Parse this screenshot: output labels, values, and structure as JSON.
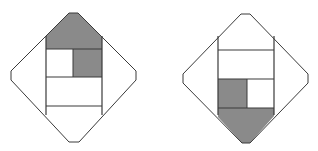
{
  "figure": {
    "width": 318,
    "height": 151,
    "background": "#ffffff",
    "stroke_color": "#3a3a3a",
    "shade_color": "#8a8a8a"
  },
  "diagrams": [
    {
      "id": "left",
      "outline": "69,13 78,13 136,71 136,80 79,142 69,142 11,80 11,71",
      "inner_rect": {
        "x1": 46,
        "x2": 102,
        "y_top": 36,
        "y_bottom": 115
      },
      "row_lines": [
        49,
        77,
        106
      ],
      "shaded_regions": [
        {
          "name": "top-pentagon",
          "points": "69,13 78,13 102,37 102,49 46,49 46,36"
        },
        {
          "name": "small-square",
          "points": "73,49 102,49 102,77 73,77"
        }
      ],
      "inner_divider": {
        "x": 73,
        "y1": 49,
        "y2": 77
      }
    },
    {
      "id": "right",
      "outline": "241,14 250,14 308,74 308,83 250,143 242,143 183,83 183,74",
      "inner_rect": {
        "x1": 218,
        "x2": 274,
        "y_top": 36,
        "y_bottom": 115
      },
      "row_lines": [
        50,
        79,
        108
      ],
      "shaded_regions": [
        {
          "name": "bottom-pentagon",
          "points": "218,108 274,108 274,116 250,143 242,143 218,117"
        },
        {
          "name": "small-square",
          "points": "218,79 247,79 247,108 218,108"
        }
      ],
      "inner_divider": {
        "x": 247,
        "y1": 79,
        "y2": 108
      }
    }
  ]
}
